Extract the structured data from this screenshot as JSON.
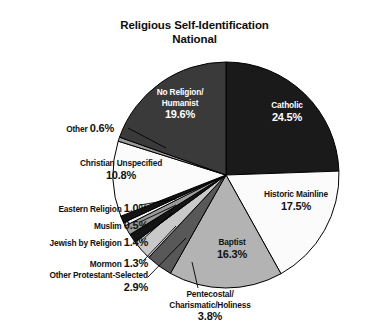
{
  "title": {
    "line1": "Religious Self-Identification",
    "line2": "National"
  },
  "chart_data": {
    "type": "pie",
    "title": "Religious Self-Identification National",
    "value_suffix": "%",
    "legend": "none (labels placed on/around slices)",
    "start_angle_deg": 0,
    "direction": "clockwise",
    "categories": [
      "Catholic",
      "Historic Mainline",
      "Baptist",
      "Pentecostal/Charismatic/Holiness",
      "Other Protestant-Selected",
      "Mormon",
      "Jewish by Religion",
      "Muslim",
      "Eastern Religion",
      "Christian Unspecified",
      "Other",
      "No Religion/Humanist"
    ],
    "values": [
      24.5,
      17.5,
      16.3,
      3.8,
      2.9,
      1.3,
      1.4,
      0.5,
      1.0,
      10.8,
      0.6,
      19.6
    ],
    "slices": [
      {
        "label": "Catholic",
        "name_line1": "Catholic",
        "name_line2": "",
        "value": 24.5,
        "display": "24.5%",
        "color": "#1a1a1a",
        "text_color": "#ffffff"
      },
      {
        "label": "Historic Mainline",
        "name_line1": "Historic Mainline",
        "name_line2": "",
        "value": 17.5,
        "display": "17.5%",
        "color": "#fbfbfb",
        "text_color": "#111111"
      },
      {
        "label": "Baptist",
        "name_line1": "Baptist",
        "name_line2": "",
        "value": 16.3,
        "display": "16.3%",
        "color": "#b3b3b3",
        "text_color": "#111111"
      },
      {
        "label": "Pentecostal/Charismatic/Holiness",
        "name_line1": "Pentecostal/",
        "name_line2": "Charismatic/Holiness",
        "value": 3.8,
        "display": "3.8%",
        "color": "#585858",
        "text_color": "#111111"
      },
      {
        "label": "Other Protestant-Selected",
        "name_line1": "Other Protestant-Selected",
        "name_line2": "",
        "value": 2.9,
        "display": "2.9%",
        "color": "#c9c9c9",
        "text_color": "#111111"
      },
      {
        "label": "Mormon",
        "name_line1": "Mormon",
        "name_line2": "",
        "value": 1.3,
        "display": "1.3%",
        "color": "#141414",
        "text_color": "#111111"
      },
      {
        "label": "Jewish by Religion",
        "name_line1": "Jewish by Religion",
        "name_line2": "",
        "value": 1.4,
        "display": "1.4%",
        "color": "#9a9a9a",
        "text_color": "#111111"
      },
      {
        "label": "Muslim",
        "name_line1": "Muslim",
        "name_line2": "",
        "value": 0.5,
        "display": "0.5%",
        "color": "#f2f2f2",
        "text_color": "#111111"
      },
      {
        "label": "Eastern Religion",
        "name_line1": "Eastern Religion",
        "name_line2": "",
        "value": 1.0,
        "display": "1.0%",
        "color": "#141414",
        "text_color": "#111111"
      },
      {
        "label": "Christian Unspecified",
        "name_line1": "Christian Unspecified",
        "name_line2": "",
        "value": 10.8,
        "display": "10.8%",
        "color": "#fbfbfb",
        "text_color": "#111111"
      },
      {
        "label": "Other",
        "name_line1": "Other",
        "name_line2": "",
        "value": 0.6,
        "display": "0.6%",
        "color": "#9a9a9a",
        "text_color": "#111111"
      },
      {
        "label": "No Religion/Humanist",
        "name_line1": "No Religion/",
        "name_line2": "Humanist",
        "value": 19.6,
        "display": "19.6%",
        "color": "#3a3a3a",
        "text_color": "#ffffff"
      }
    ],
    "geometry": {
      "center_x": 226,
      "center_y": 175,
      "radius": 113
    }
  },
  "labels": {
    "catholic": {
      "name": "Catholic",
      "pct": "24.5%"
    },
    "mainline": {
      "name": "Historic Mainline",
      "pct": "17.5%"
    },
    "baptist": {
      "name": "Baptist",
      "pct": "16.3%"
    },
    "pentecostal": {
      "name1": "Pentecostal/",
      "name2": "Charismatic/Holiness",
      "pct": "3.8%"
    },
    "otherprot": {
      "name": "Other Protestant-Selected",
      "pct": "2.9%"
    },
    "mormon": {
      "name": "Mormon ",
      "pct": "1.3%"
    },
    "jewish": {
      "name": "Jewish by Religion ",
      "pct": "1.4%"
    },
    "muslim": {
      "name": "Muslim ",
      "pct": "0.5%"
    },
    "eastern": {
      "name": "Eastern Religion ",
      "pct": "1.0%"
    },
    "christunspec": {
      "name": "Christian Unspecified",
      "pct": "10.8%"
    },
    "other": {
      "name": "Other ",
      "pct": "0.6%"
    },
    "norelig": {
      "name1": "No Religion/",
      "name2": "Humanist",
      "pct": "19.6%"
    }
  },
  "colors": {
    "background": "#ffffff",
    "outline": "#000000",
    "text": "#111111",
    "text_on_dark": "#ffffff"
  }
}
